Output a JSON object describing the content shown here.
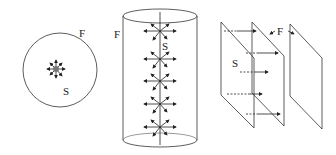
{
  "figure": {
    "panels": [
      {
        "id": "sphere",
        "description": "Point charge enclosed by spherical Gaussian surface",
        "labels": {
          "surface": "F",
          "charge": "S"
        }
      },
      {
        "id": "cylinder",
        "description": "Line charge enclosed by cylindrical Gaussian surface",
        "labels": {
          "surface": "F",
          "charge": "S"
        }
      },
      {
        "id": "plane",
        "description": "Charged plane between two parallel Gaussian planes",
        "labels": {
          "surface": "F",
          "charge": "S"
        }
      }
    ],
    "colors": {
      "stroke": "#333333",
      "charge": "#777777",
      "background": "#ffffff"
    }
  }
}
